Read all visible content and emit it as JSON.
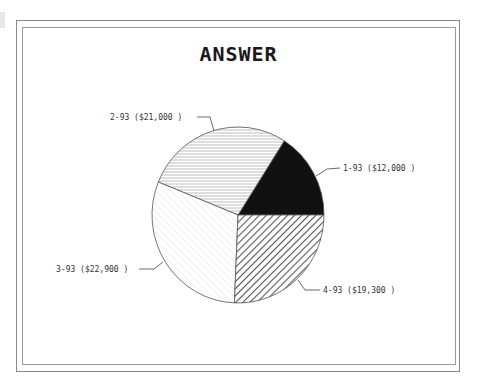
{
  "chart_data": {
    "type": "pie",
    "title": "ANSWER",
    "categories": [
      "1-93",
      "2-93",
      "3-93",
      "4-93"
    ],
    "values": [
      12000,
      21000,
      22900,
      19300
    ],
    "labels": [
      "1-93 ($12,000 )",
      "2-93 ($21,000 )",
      "3-93 ($22,900 )",
      "4-93 ($19,300 )"
    ],
    "patterns": [
      "solid-black",
      "horizontal-lines-light",
      "diagonal-lines-faint",
      "diagonal-lines-dark"
    ],
    "start_angle_deg": 0,
    "direction": "counterclockwise",
    "legend": "none (callout labels)"
  },
  "colors": {
    "slice_1": "#111111",
    "slice_2_lines": "#bdbdbd",
    "slice_3_lines": "#e2e2e2",
    "slice_4_lines": "#555555",
    "outline": "#555555",
    "frame": "#8a8a8a"
  }
}
